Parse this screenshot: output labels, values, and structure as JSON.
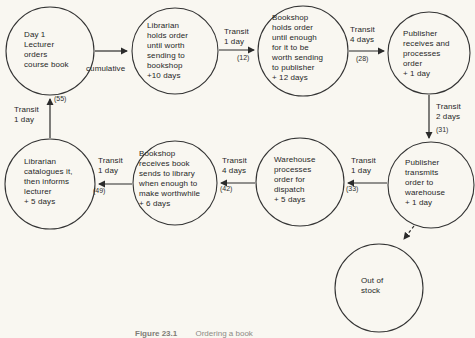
{
  "figure": {
    "caption_number": "Figure 23.1",
    "caption_text": "Ordering a book",
    "paper_color": "#f9f7f1",
    "ink_color": "#2b2b2b"
  },
  "nodes": [
    {
      "id": "lecturer-orders",
      "label": "Day 1\nLecturer\norders\ncourse book"
    },
    {
      "id": "librarian-holds",
      "label": "Librarian\nholds order\nuntil worth\nsending to\nbookshop\n+10 days"
    },
    {
      "id": "bookshop-holds",
      "label": "Bookshop\nholds order\nuntil enough\nfor it to be\nworth sending\nto publisher\n+ 12 days"
    },
    {
      "id": "publisher-receives",
      "label": "Publisher\nreceives and\nprocesses\norder\n+ 1 day"
    },
    {
      "id": "publisher-transmits",
      "label": "Publisher\ntransmits\norder to\nwarehouse\n+ 1 day"
    },
    {
      "id": "warehouse-processes",
      "label": "Warehouse\nprocesses\norder for\ndispatch\n+ 5 days"
    },
    {
      "id": "bookshop-receives",
      "label": "Bookshop\nreceives book\nsends to library\nwhen enough to\nmake worthwhile\n+ 6 days"
    },
    {
      "id": "librarian-catalogues",
      "label": "Librarian\ncatalogues it,\nthen informs\nlecturer\n+ 5 days"
    },
    {
      "id": "out-of-stock",
      "label": "Out of\nstock"
    }
  ],
  "edges": [
    {
      "id": "lecturer-to-librarian",
      "label": "cumulative",
      "count": ""
    },
    {
      "id": "librarian-to-bookshop",
      "label": "Transit\n1 day",
      "count": "(12)"
    },
    {
      "id": "bookshop-to-publisher",
      "label": "Transit\n4 days",
      "count": "(28)"
    },
    {
      "id": "receives-to-transmits",
      "label": "Transit\n2 days",
      "count": "(31)"
    },
    {
      "id": "transmits-to-warehouse",
      "label": "Transit\n1 day",
      "count": "(33)"
    },
    {
      "id": "warehouse-to-bookshop",
      "label": "Transit\n4 days",
      "count": "(42)"
    },
    {
      "id": "bookshop-to-librarian",
      "label": "Transit\n1 day",
      "count": "(49)"
    },
    {
      "id": "librarian-to-lecturer",
      "label": "Transit\n1 day",
      "count": "(55)"
    },
    {
      "id": "transmits-to-out-of-stock",
      "label": "",
      "count": ""
    }
  ]
}
